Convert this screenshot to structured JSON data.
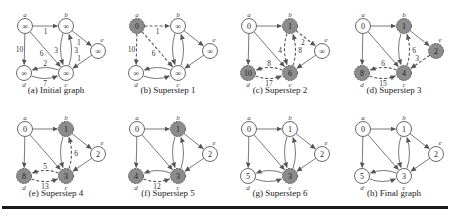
{
  "figure": {
    "node_names": [
      "a",
      "b",
      "c",
      "d",
      "e"
    ],
    "positions": {
      "a": [
        25,
        26
      ],
      "b": [
        66,
        26
      ],
      "c": [
        66,
        73
      ],
      "d": [
        24,
        73
      ],
      "e": [
        98,
        51
      ]
    },
    "colors": {
      "active_fill": "#8c8c8c",
      "inactive_fill": "#ffffff",
      "stroke": "#444444",
      "edge": "#555555"
    },
    "panels": [
      {
        "id": "a",
        "caption": "(a) Initial graph",
        "values": {
          "a": "∞",
          "b": "∞",
          "c": "∞",
          "d": "∞",
          "e": "∞"
        },
        "active": [],
        "edges": [
          {
            "from": "a",
            "to": "b",
            "w": "1",
            "dashed": false
          },
          {
            "from": "a",
            "to": "d",
            "w": "10",
            "dashed": false
          },
          {
            "from": "a",
            "to": "c",
            "w": "6",
            "dashed": false
          },
          {
            "from": "b",
            "to": "c",
            "w": "3",
            "dashed": false,
            "curve": -1
          },
          {
            "from": "c",
            "to": "b",
            "w": "3",
            "dashed": false,
            "curve": -1
          },
          {
            "from": "b",
            "to": "e",
            "w": "1",
            "dashed": false
          },
          {
            "from": "e",
            "to": "c",
            "w": "1",
            "dashed": false
          },
          {
            "from": "d",
            "to": "c",
            "w": "7",
            "dashed": false,
            "curve": -1
          },
          {
            "from": "c",
            "to": "d",
            "w": "2",
            "dashed": false,
            "curve": -1
          }
        ]
      },
      {
        "id": "b",
        "caption": "(b) Superstep 1",
        "values": {
          "a": "0",
          "b": "∞",
          "c": "∞",
          "d": "∞",
          "e": "∞"
        },
        "active": [
          "a"
        ],
        "edges": [
          {
            "from": "a",
            "to": "b",
            "w": "1",
            "dashed": true
          },
          {
            "from": "a",
            "to": "d",
            "w": "10",
            "dashed": true
          },
          {
            "from": "a",
            "to": "c",
            "w": "6",
            "dashed": true
          },
          {
            "from": "b",
            "to": "c",
            "w": "",
            "dashed": false,
            "curve": -1
          },
          {
            "from": "c",
            "to": "b",
            "w": "",
            "dashed": false,
            "curve": -1
          },
          {
            "from": "b",
            "to": "e",
            "w": "",
            "dashed": false
          },
          {
            "from": "e",
            "to": "c",
            "w": "",
            "dashed": false
          },
          {
            "from": "d",
            "to": "c",
            "w": "",
            "dashed": false,
            "curve": -1
          },
          {
            "from": "c",
            "to": "d",
            "w": "",
            "dashed": false,
            "curve": -1
          }
        ]
      },
      {
        "id": "c",
        "caption": "(c) Superstep 2",
        "values": {
          "a": "0",
          "b": "1",
          "c": "6",
          "d": "10",
          "e": "∞"
        },
        "active": [
          "b",
          "c",
          "d"
        ],
        "edges": [
          {
            "from": "a",
            "to": "b",
            "w": "",
            "dashed": false
          },
          {
            "from": "a",
            "to": "d",
            "w": "",
            "dashed": false
          },
          {
            "from": "a",
            "to": "c",
            "w": "",
            "dashed": false
          },
          {
            "from": "b",
            "to": "c",
            "w": "4",
            "dashed": true,
            "curve": -1
          },
          {
            "from": "c",
            "to": "b",
            "w": "8",
            "dashed": true,
            "curve": -1
          },
          {
            "from": "b",
            "to": "e",
            "w": "2",
            "dashed": true
          },
          {
            "from": "e",
            "to": "c",
            "w": "",
            "dashed": false
          },
          {
            "from": "d",
            "to": "c",
            "w": "17",
            "dashed": true,
            "curve": -1
          },
          {
            "from": "c",
            "to": "d",
            "w": "8",
            "dashed": true,
            "curve": -1
          }
        ]
      },
      {
        "id": "d",
        "caption": "(d) Superstep 3",
        "values": {
          "a": "0",
          "b": "1",
          "c": "4",
          "d": "8",
          "e": "2"
        },
        "active": [
          "b",
          "c",
          "d",
          "e"
        ],
        "edges": [
          {
            "from": "a",
            "to": "b",
            "w": "",
            "dashed": false
          },
          {
            "from": "a",
            "to": "d",
            "w": "",
            "dashed": false
          },
          {
            "from": "a",
            "to": "c",
            "w": "",
            "dashed": false
          },
          {
            "from": "b",
            "to": "c",
            "w": "",
            "dashed": false,
            "curve": -1
          },
          {
            "from": "c",
            "to": "b",
            "w": "6",
            "dashed": true,
            "curve": -1
          },
          {
            "from": "b",
            "to": "e",
            "w": "",
            "dashed": false
          },
          {
            "from": "e",
            "to": "c",
            "w": "3",
            "dashed": true
          },
          {
            "from": "d",
            "to": "c",
            "w": "15",
            "dashed": true,
            "curve": -1
          },
          {
            "from": "c",
            "to": "d",
            "w": "6",
            "dashed": true,
            "curve": -1
          }
        ]
      },
      {
        "id": "e",
        "caption": "(e) Superstep 4",
        "values": {
          "a": "0",
          "b": "1",
          "c": "3",
          "d": "8",
          "e": "2"
        },
        "active": [
          "b",
          "c",
          "d"
        ],
        "edges": [
          {
            "from": "a",
            "to": "b",
            "w": "",
            "dashed": false
          },
          {
            "from": "a",
            "to": "d",
            "w": "",
            "dashed": false
          },
          {
            "from": "a",
            "to": "c",
            "w": "",
            "dashed": false
          },
          {
            "from": "b",
            "to": "c",
            "w": "",
            "dashed": false,
            "curve": -1
          },
          {
            "from": "c",
            "to": "b",
            "w": "6",
            "dashed": true,
            "curve": -1
          },
          {
            "from": "b",
            "to": "e",
            "w": "",
            "dashed": false
          },
          {
            "from": "e",
            "to": "c",
            "w": "",
            "dashed": false
          },
          {
            "from": "d",
            "to": "c",
            "w": "13",
            "dashed": true,
            "curve": -1
          },
          {
            "from": "c",
            "to": "d",
            "w": "5",
            "dashed": true,
            "curve": -1
          }
        ]
      },
      {
        "id": "f",
        "caption": "(f) Superstep 5",
        "values": {
          "a": "0",
          "b": "1",
          "c": "3",
          "d": "4",
          "e": "2"
        },
        "active": [
          "b",
          "c",
          "d"
        ],
        "edges": [
          {
            "from": "a",
            "to": "b",
            "w": "",
            "dashed": false
          },
          {
            "from": "a",
            "to": "d",
            "w": "",
            "dashed": false
          },
          {
            "from": "a",
            "to": "c",
            "w": "",
            "dashed": false
          },
          {
            "from": "b",
            "to": "c",
            "w": "",
            "dashed": false,
            "curve": -1
          },
          {
            "from": "c",
            "to": "b",
            "w": "",
            "dashed": false,
            "curve": -1
          },
          {
            "from": "b",
            "to": "e",
            "w": "",
            "dashed": false
          },
          {
            "from": "e",
            "to": "c",
            "w": "",
            "dashed": false
          },
          {
            "from": "d",
            "to": "c",
            "w": "12",
            "dashed": true,
            "curve": -1
          },
          {
            "from": "c",
            "to": "d",
            "w": "",
            "dashed": false,
            "curve": -1
          }
        ]
      },
      {
        "id": "g",
        "caption": "(g) Superstep 6",
        "values": {
          "a": "0",
          "b": "1",
          "c": "3",
          "d": "5",
          "e": "2"
        },
        "active": [
          "c"
        ],
        "edges": [
          {
            "from": "a",
            "to": "b",
            "w": "",
            "dashed": false
          },
          {
            "from": "a",
            "to": "d",
            "w": "",
            "dashed": false
          },
          {
            "from": "a",
            "to": "c",
            "w": "",
            "dashed": false
          },
          {
            "from": "b",
            "to": "c",
            "w": "",
            "dashed": false,
            "curve": -1
          },
          {
            "from": "c",
            "to": "b",
            "w": "",
            "dashed": false,
            "curve": -1
          },
          {
            "from": "b",
            "to": "e",
            "w": "",
            "dashed": false
          },
          {
            "from": "e",
            "to": "c",
            "w": "",
            "dashed": false
          },
          {
            "from": "d",
            "to": "c",
            "w": "",
            "dashed": false,
            "curve": -1
          },
          {
            "from": "c",
            "to": "d",
            "w": "",
            "dashed": false,
            "curve": -1
          }
        ]
      },
      {
        "id": "h",
        "caption": "(h) Final graph",
        "values": {
          "a": "0",
          "b": "1",
          "c": "3",
          "d": "5",
          "e": "2"
        },
        "active": [],
        "edges": [
          {
            "from": "a",
            "to": "b",
            "w": "",
            "dashed": false
          },
          {
            "from": "a",
            "to": "d",
            "w": "",
            "dashed": false
          },
          {
            "from": "a",
            "to": "c",
            "w": "",
            "dashed": false
          },
          {
            "from": "b",
            "to": "c",
            "w": "",
            "dashed": false,
            "curve": -1
          },
          {
            "from": "c",
            "to": "b",
            "w": "",
            "dashed": false,
            "curve": -1
          },
          {
            "from": "b",
            "to": "e",
            "w": "",
            "dashed": false
          },
          {
            "from": "e",
            "to": "c",
            "w": "",
            "dashed": false
          },
          {
            "from": "d",
            "to": "c",
            "w": "",
            "dashed": false,
            "curve": -1
          },
          {
            "from": "c",
            "to": "d",
            "w": "",
            "dashed": false,
            "curve": -1
          }
        ]
      }
    ]
  }
}
